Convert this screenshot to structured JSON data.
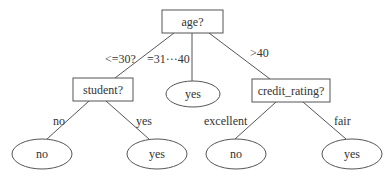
{
  "diagram": {
    "type": "decision-tree",
    "root": {
      "label": "age?",
      "shape": "rectangle"
    },
    "internal_nodes": [
      {
        "id": "student",
        "label": "student?",
        "shape": "rectangle"
      },
      {
        "id": "credit_rating",
        "label": "credit_rating?",
        "shape": "rectangle"
      }
    ],
    "leaves": [
      {
        "id": "mid_yes",
        "label": "yes",
        "shape": "ellipse"
      },
      {
        "id": "student_no",
        "label": "no",
        "shape": "ellipse"
      },
      {
        "id": "student_yes",
        "label": "yes",
        "shape": "ellipse"
      },
      {
        "id": "credit_no",
        "label": "no",
        "shape": "ellipse"
      },
      {
        "id": "credit_yes",
        "label": "yes",
        "shape": "ellipse"
      }
    ],
    "edges": [
      {
        "from": "age",
        "to": "student",
        "label": "<=30?"
      },
      {
        "from": "age",
        "to": "mid_yes",
        "label": "=31···40"
      },
      {
        "from": "age",
        "to": "credit_rating",
        "label": ">40"
      },
      {
        "from": "student",
        "to": "student_no",
        "label": "no"
      },
      {
        "from": "student",
        "to": "student_yes",
        "label": "yes"
      },
      {
        "from": "credit_rating",
        "to": "credit_no",
        "label": "excellent"
      },
      {
        "from": "credit_rating",
        "to": "credit_yes",
        "label": "fair"
      }
    ]
  }
}
